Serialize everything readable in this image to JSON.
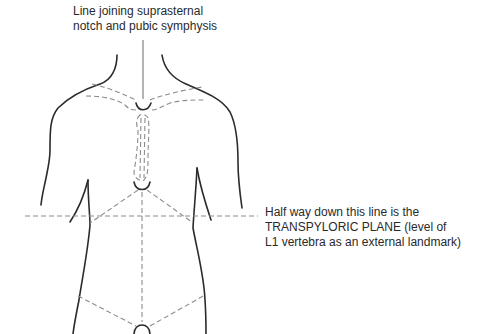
{
  "labels": {
    "top": {
      "line1": "Line joining suprasternal",
      "line2": "notch and pubic symphysis"
    },
    "right": {
      "line1": "Half way down this line is the",
      "line2": "TRANSPYLORIC PLANE (level of",
      "line3": "L1 vertebra as an external landmark)"
    }
  },
  "figure": {
    "landmarks": [
      "suprasternal notch",
      "clavicles",
      "sternum",
      "xiphisternum",
      "transpyloric plane",
      "inguinal ligaments",
      "pubic symphysis"
    ]
  }
}
